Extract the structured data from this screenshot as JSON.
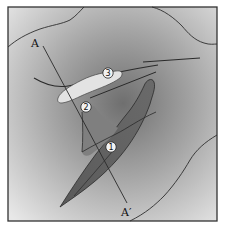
{
  "figure": {
    "type": "schematic map / geological diagram",
    "section_line": {
      "start_label": "A",
      "end_label": "A′"
    },
    "markers": [
      {
        "id": 1,
        "label": "1"
      },
      {
        "id": 2,
        "label": "2"
      },
      {
        "id": 3,
        "label": "3"
      }
    ],
    "colors": {
      "frame": "#333333",
      "background_light": "#e6e6e6",
      "background_dark": "#7a7a7a",
      "light_body": "#e2e2e2",
      "dark_body": "#5e5e5e",
      "lines": "#2a2a2a"
    }
  }
}
